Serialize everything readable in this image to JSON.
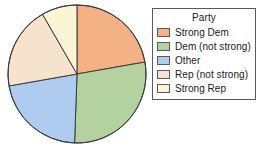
{
  "chart_data": {
    "type": "pie",
    "title": "",
    "legend_title": "Party",
    "legend_position": "right",
    "grid": false,
    "categories": [
      "Strong Dem",
      "Dem (not strong)",
      "Other",
      "Rep (not strong)",
      "Strong Rep"
    ],
    "values": [
      22,
      28,
      22,
      19,
      9
    ],
    "units": "percent",
    "start_angle_deg": 0,
    "direction": "clockwise",
    "slices": [
      {
        "label": "Strong Dem",
        "value": 22,
        "color": "#f4b183",
        "start_deg": 0,
        "end_deg": 80
      },
      {
        "label": "Dem (not strong)",
        "value": 28,
        "color": "#b4d1a0",
        "start_deg": 80,
        "end_deg": 182
      },
      {
        "label": "Other",
        "value": 22,
        "color": "#aecbf0",
        "start_deg": 182,
        "end_deg": 260
      },
      {
        "label": "Rep (not strong)",
        "value": 19,
        "color": "#f7e2cd",
        "start_deg": 260,
        "end_deg": 330
      },
      {
        "label": "Strong Rep",
        "value": 9,
        "color": "#fbf4d5",
        "start_deg": 330,
        "end_deg": 360
      }
    ],
    "xlabel": "",
    "ylabel": ""
  },
  "legend": {
    "title": "Party",
    "items": [
      {
        "label": "Strong Dem",
        "color": "#f4b183"
      },
      {
        "label": "Dem (not strong)",
        "color": "#b4d1a0"
      },
      {
        "label": "Other",
        "color": "#aecbf0"
      },
      {
        "label": "Rep (not strong)",
        "color": "#f7e2cd"
      },
      {
        "label": "Strong Rep",
        "color": "#fbf4d5"
      }
    ]
  },
  "style": {
    "pie_outline": "#3c3c3c",
    "legend_border": "#5a5a5a",
    "text_color": "#1a1a1a",
    "background": "#ffffff"
  },
  "geometry": {
    "center_x": 77,
    "center_y": 74,
    "radius": 69
  }
}
